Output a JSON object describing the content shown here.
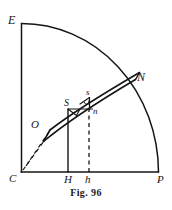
{
  "figure": {
    "caption": "Fig. 96",
    "background_color": "#ffffff",
    "ink_color": "#151515",
    "labels": {
      "E": "E",
      "N": "N",
      "S_upper_case": "S",
      "s_lower_case": "s",
      "n_foot": "n",
      "O": "O",
      "C": "C",
      "H": "H",
      "h": "h",
      "P": "P"
    },
    "geometry": {
      "center": "C",
      "quadrant_top": "E",
      "quadrant_right": "P",
      "arc_point": "N",
      "band_near_end": "O",
      "band_points": [
        "S",
        "s",
        "n"
      ],
      "baseline_feet": [
        "C",
        "H",
        "h",
        "P"
      ],
      "solid_vertical_from": "H",
      "dashed_vertical_from": "h",
      "dashed_rays_from": "C"
    }
  }
}
